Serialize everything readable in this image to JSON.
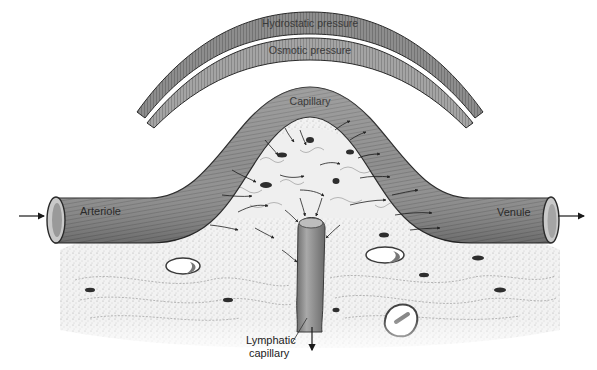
{
  "figure": {
    "type": "anatomical-diagram"
  },
  "labels": {
    "hydrostatic": "Hydrostatic pressure",
    "osmotic": "Osmotic pressure",
    "capillary": "Capillary",
    "arteriole": "Arteriole",
    "venule": "Venule",
    "lymphatic_line1": "Lymphatic",
    "lymphatic_line2": "capillary"
  },
  "flow_arrows": {
    "inflow": "arteriole-inflow",
    "outflow": "venule-outflow",
    "lymph_drain": "lymphatic-drainage-down"
  },
  "colors": {
    "vessel": "#8d8d8d",
    "vessel_dark": "#4a4a4a",
    "arc_outer": "#777777",
    "arc_inner": "#9a9a9a",
    "tissue": "#ececec",
    "ink": "#1a1a1a"
  }
}
